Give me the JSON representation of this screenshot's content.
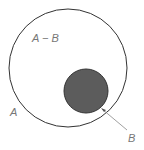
{
  "diagram": {
    "type": "venn",
    "labels": {
      "difference": "A − B",
      "outer_set": "A",
      "inner_set": "B"
    },
    "colors": {
      "outer_stroke": "#333333",
      "inner_fill": "#5c5c5c",
      "label": "#777777"
    }
  }
}
